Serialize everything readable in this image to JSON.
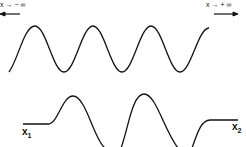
{
  "diagram": {
    "top_wave": {
      "label_left": "x → − ∞",
      "label_right": "x → + ∞",
      "arrow_left": "left-arrow",
      "arrow_right": "right-arrow"
    },
    "bottom_wave": {
      "label_left": "x",
      "label_left_sub": "1",
      "label_right": "x",
      "label_right_sub": "2"
    },
    "colors": {
      "stroke": "#111111",
      "background": "#ffffff"
    }
  }
}
